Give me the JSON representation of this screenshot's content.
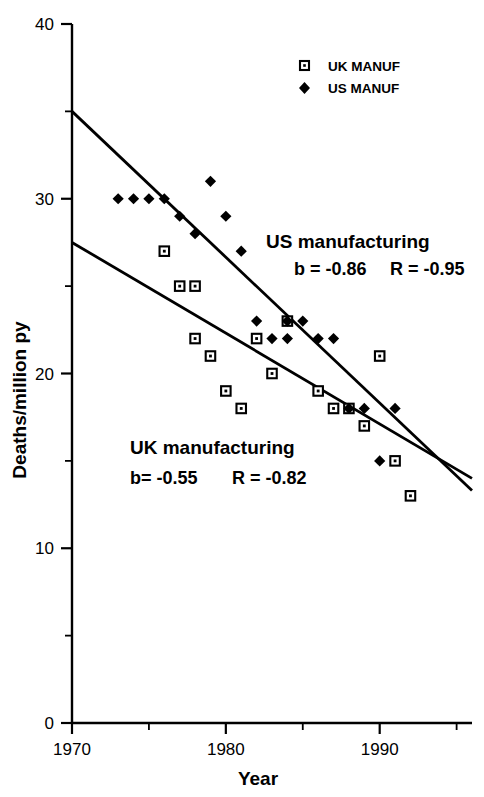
{
  "chart_data": {
    "type": "scatter",
    "title": "",
    "xlabel": "Year",
    "ylabel": "Deaths/million py",
    "xlim": [
      1970,
      1996
    ],
    "ylim": [
      0,
      40
    ],
    "xticks": [
      1970,
      1980,
      1990
    ],
    "xticklabels": [
      "1970",
      "1980",
      "1990"
    ],
    "xminorticks": [
      1975,
      1985,
      1995
    ],
    "yticks": [
      0,
      10,
      20,
      30,
      40
    ],
    "yticklabels": [
      "0",
      "10",
      "20",
      "30",
      "40"
    ],
    "yminorticks": [
      5,
      15,
      25,
      35
    ],
    "grid": false,
    "legend_position": "top-right",
    "legend": [
      {
        "label": "UK MANUF",
        "marker": "open-square",
        "series": "uk"
      },
      {
        "label": "US MANUF",
        "marker": "filled-diamond",
        "series": "us"
      }
    ],
    "series": [
      {
        "name": "UK MANUF",
        "marker": "open-square",
        "points": [
          {
            "x": 1976,
            "y": 27
          },
          {
            "x": 1977,
            "y": 25
          },
          {
            "x": 1978,
            "y": 25
          },
          {
            "x": 1978,
            "y": 22
          },
          {
            "x": 1979,
            "y": 21
          },
          {
            "x": 1980,
            "y": 19
          },
          {
            "x": 1981,
            "y": 18
          },
          {
            "x": 1982,
            "y": 22
          },
          {
            "x": 1983,
            "y": 20
          },
          {
            "x": 1984,
            "y": 23
          },
          {
            "x": 1986,
            "y": 19
          },
          {
            "x": 1987,
            "y": 18
          },
          {
            "x": 1988,
            "y": 18
          },
          {
            "x": 1989,
            "y": 17
          },
          {
            "x": 1990,
            "y": 21
          },
          {
            "x": 1991,
            "y": 15
          },
          {
            "x": 1992,
            "y": 13
          }
        ]
      },
      {
        "name": "US MANUF",
        "marker": "filled-diamond",
        "points": [
          {
            "x": 1973,
            "y": 30
          },
          {
            "x": 1974,
            "y": 30
          },
          {
            "x": 1975,
            "y": 30
          },
          {
            "x": 1976,
            "y": 30
          },
          {
            "x": 1977,
            "y": 29
          },
          {
            "x": 1978,
            "y": 28
          },
          {
            "x": 1979,
            "y": 31
          },
          {
            "x": 1980,
            "y": 29
          },
          {
            "x": 1981,
            "y": 27
          },
          {
            "x": 1982,
            "y": 23
          },
          {
            "x": 1983,
            "y": 22
          },
          {
            "x": 1984,
            "y": 23
          },
          {
            "x": 1984,
            "y": 22
          },
          {
            "x": 1985,
            "y": 23
          },
          {
            "x": 1986,
            "y": 22
          },
          {
            "x": 1987,
            "y": 22
          },
          {
            "x": 1988,
            "y": 18
          },
          {
            "x": 1989,
            "y": 18
          },
          {
            "x": 1990,
            "y": 15
          },
          {
            "x": 1991,
            "y": 18
          }
        ]
      }
    ],
    "fit_lines": [
      {
        "name": "US manufacturing fit",
        "x1": 1970,
        "y1": 35.0,
        "x2": 1996,
        "y2": 13.3
      },
      {
        "name": "UK manufacturing fit",
        "x1": 1970,
        "y1": 27.5,
        "x2": 1996,
        "y2": 14.0
      }
    ],
    "annotations": [
      {
        "id": "us",
        "title": "US manufacturing",
        "slope_label": "b = -0.86",
        "r_label": "R = -0.95",
        "slope_value": -0.86,
        "r_value": -0.95
      },
      {
        "id": "uk",
        "title": "UK manufacturing",
        "slope_label": "b= -0.55",
        "r_label": "R = -0.82",
        "slope_value": -0.55,
        "r_value": -0.82
      }
    ]
  },
  "axes": {
    "x_title": "Year",
    "y_title": "Deaths/million py",
    "x_tick_labels": [
      "1970",
      "1980",
      "1990"
    ],
    "y_tick_labels": [
      "0",
      "10",
      "20",
      "30",
      "40"
    ]
  },
  "legend": {
    "uk_label": "UK MANUF",
    "us_label": "US MANUF"
  },
  "annotations": {
    "us_title": "US manufacturing",
    "us_slope": "b = -0.86",
    "us_r": "R = -0.95",
    "uk_title": "UK manufacturing",
    "uk_slope": "b= -0.55",
    "uk_r": "R = -0.82"
  },
  "colors": {
    "ink": "#000000",
    "background": "#ffffff"
  }
}
